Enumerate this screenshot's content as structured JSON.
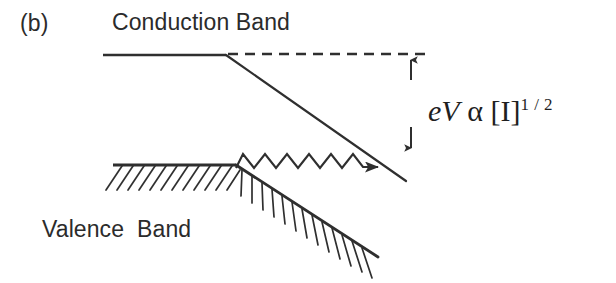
{
  "figure": {
    "panel_label": "(b)",
    "conduction_band_label": "Conduction Band",
    "valence_band_label": "Valence  Band",
    "equation": {
      "term_e": "e",
      "term_V": "V",
      "proportional_symbol": "α",
      "bracket_open": "[",
      "species": "I",
      "bracket_close": "]",
      "exponent": "1 / 2",
      "full_text": "eV α [I]1/2"
    },
    "colors": {
      "line": "#2f2f2f",
      "text": "#2b2b2b",
      "background": "#ffffff"
    },
    "elements": {
      "conduction_band_flat": "horizontal conduction band edge",
      "conduction_band_slope": "downward sloping conduction band edge",
      "flat_band_reference": "dashed flat-band reference level",
      "band_bending_arrow_up": "upward arrow of band bending gap",
      "band_bending_arrow_down": "downward arrow of band bending gap",
      "zigzag_arrow": "zigzag electron transition arrow",
      "valence_band_flat": "horizontal valence band edge with hatching",
      "valence_band_slope": "sloping valence band edge with hatching"
    }
  }
}
